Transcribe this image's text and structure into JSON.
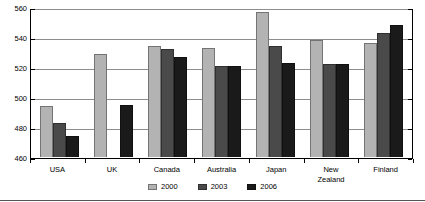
{
  "chart_data": {
    "type": "bar",
    "title": "",
    "xlabel": "",
    "ylabel": "",
    "ylim": [
      460,
      560
    ],
    "yticks": [
      460,
      480,
      500,
      520,
      540,
      560
    ],
    "grid": true,
    "legend_position": "bottom",
    "categories": [
      "USA",
      "UK",
      "Canada",
      "Australia",
      "Japan",
      "New\nZealand",
      "Finland"
    ],
    "category_labels": [
      {
        "line1": "USA",
        "line2": ""
      },
      {
        "line1": "UK",
        "line2": ""
      },
      {
        "line1": "Canada",
        "line2": ""
      },
      {
        "line1": "Australia",
        "line2": ""
      },
      {
        "line1": "Japan",
        "line2": ""
      },
      {
        "line1": "New",
        "line2": "Zealand"
      },
      {
        "line1": "Finland",
        "line2": ""
      }
    ],
    "series": [
      {
        "name": "2000",
        "color": "#b3b3b3",
        "values": [
          494,
          529,
          534,
          533,
          557,
          538,
          536
        ]
      },
      {
        "name": "2003",
        "color": "#4a4a4a",
        "values": [
          483,
          null,
          532,
          521,
          534,
          522,
          543
        ]
      },
      {
        "name": "2006",
        "color": "#1a1a1a",
        "values": [
          474,
          495,
          527,
          521,
          523,
          522,
          548
        ]
      }
    ]
  },
  "legend": {
    "items": [
      {
        "label": "2000",
        "color": "#b3b3b3"
      },
      {
        "label": "2003",
        "color": "#4a4a4a"
      },
      {
        "label": "2006",
        "color": "#1a1a1a"
      }
    ]
  },
  "colors": {
    "series_2000": "#b3b3b3",
    "series_2003": "#4a4a4a",
    "series_2006": "#1a1a1a",
    "gridline": "#8d8d8d",
    "axis": "#000000",
    "background": "#ffffff"
  }
}
